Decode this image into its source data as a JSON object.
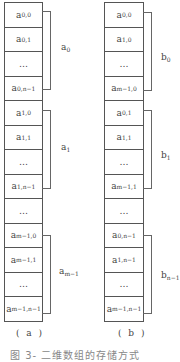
{
  "diagram": {
    "left": {
      "sublabel": "( a )",
      "cells": [
        {
          "base": "a",
          "sub": "0,0"
        },
        {
          "base": "a",
          "sub": "0,1"
        },
        {
          "base": "…",
          "sub": ""
        },
        {
          "base": "a",
          "sub": "0,n−1"
        },
        {
          "base": "a",
          "sub": "1,0"
        },
        {
          "base": "a",
          "sub": "1,1"
        },
        {
          "base": "…",
          "sub": ""
        },
        {
          "base": "a",
          "sub": "1,n−1"
        },
        {
          "base": "…",
          "sub": ""
        },
        {
          "base": "a",
          "sub": "m−1,0"
        },
        {
          "base": "a",
          "sub": "m−1,1"
        },
        {
          "base": "…",
          "sub": ""
        },
        {
          "base": "a",
          "sub": "m−1,n−1"
        }
      ],
      "groups": [
        {
          "base": "a",
          "sub": "0"
        },
        {
          "base": "a",
          "sub": "1"
        },
        {
          "base": "a",
          "sub": "m−1"
        }
      ]
    },
    "right": {
      "sublabel": "( b )",
      "cells": [
        {
          "base": "a",
          "sub": "0,0"
        },
        {
          "base": "a",
          "sub": "1,0"
        },
        {
          "base": "…",
          "sub": ""
        },
        {
          "base": "a",
          "sub": "m−1,0"
        },
        {
          "base": "a",
          "sub": "0,1"
        },
        {
          "base": "a",
          "sub": "1,1"
        },
        {
          "base": "…",
          "sub": ""
        },
        {
          "base": "a",
          "sub": "m−1,1"
        },
        {
          "base": "…",
          "sub": ""
        },
        {
          "base": "a",
          "sub": "0,n−1"
        },
        {
          "base": "a",
          "sub": "1,n−1"
        },
        {
          "base": "…",
          "sub": ""
        },
        {
          "base": "a",
          "sub": "m−1,n−1"
        }
      ],
      "groups": [
        {
          "base": "b",
          "sub": "0"
        },
        {
          "base": "b",
          "sub": "1"
        },
        {
          "base": "b",
          "sub": "n−1"
        }
      ]
    },
    "caption": "图 3-   二维数组的存储方式"
  }
}
